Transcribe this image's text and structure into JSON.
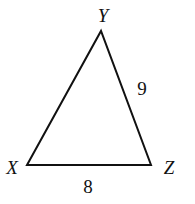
{
  "diagram": {
    "type": "triangle",
    "vertices": [
      {
        "name": "X",
        "label": "X"
      },
      {
        "name": "Y",
        "label": "Y"
      },
      {
        "name": "Z",
        "label": "Z"
      }
    ],
    "sides": [
      {
        "between": "XZ",
        "label": "8"
      },
      {
        "between": "YZ",
        "label": "9"
      }
    ],
    "stroke_color": "#111111"
  }
}
